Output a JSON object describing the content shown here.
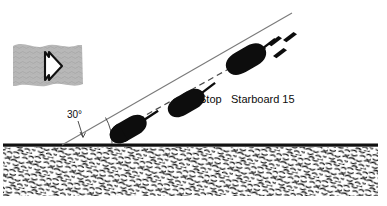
{
  "diagram": {
    "labels": {
      "stop": "Stop",
      "starboard": "Starboard 15",
      "angle": "30°"
    },
    "colors": {
      "vessel": "#0d0d0d",
      "seabed_line": "#111111",
      "seabed_fill": "#ffffff",
      "seabed_texture": "#1a1a1a",
      "current_patch": "#b4b4b4",
      "current_arrow": "#111111",
      "track_line": "#6b6b6b",
      "centre_line": "#4a4a4a",
      "text": "#0d0d0d"
    },
    "elements": {
      "current_patch_name": "current-indicator-patch",
      "current_arrow_name": "current-direction-arrow",
      "seabed_name": "seabed-shoreline",
      "track_line_name": "approach-track-line",
      "centre_line_name": "vessel-centre-track",
      "angle_arc_name": "approach-angle-arc",
      "angle_leader_name": "angle-leader-arrow"
    },
    "vessels": [
      {
        "name": "vessel-lower",
        "note": "initial approach position"
      },
      {
        "name": "vessel-middle",
        "note": "position at Stop order"
      },
      {
        "name": "vessel-upper",
        "note": "position at Starboard 15 order, with wake marks"
      }
    ],
    "wake_marks": 3
  }
}
